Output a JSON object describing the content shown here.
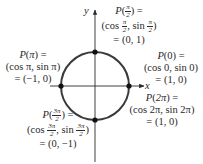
{
  "diagram": {
    "axes": {
      "x_label": "x",
      "y_label": "y"
    },
    "circle": {
      "center": [
        0,
        0
      ],
      "radius": 1,
      "color": "#3a3a3a"
    },
    "points": [
      {
        "id": "p_pi_over_2",
        "line1": "P(π/2) =",
        "line2": "(cos π/2, sin π/2)",
        "line3": "= (0, 1)",
        "coords": [
          0,
          1
        ]
      },
      {
        "id": "p_pi",
        "line1": "P(π) =",
        "line2": "(cos π, sin π)",
        "line3": "= (−1, 0)",
        "coords": [
          -1,
          0
        ]
      },
      {
        "id": "p_0",
        "line1": "P(0) =",
        "line2": "(cos 0, sin 0)",
        "line3": "= (1, 0)",
        "coords": [
          1,
          0
        ]
      },
      {
        "id": "p_2pi",
        "line1": "P(2π) =",
        "line2": "(cos 2π, sin 2π)",
        "line3": "= (1, 0)",
        "coords": [
          1,
          0
        ]
      },
      {
        "id": "p_3pi_over_2",
        "line1": "P(3π/2) =",
        "line2": "(cos 3π/2, sin 3π/2)",
        "line3": "= (0, −1)",
        "coords": [
          0,
          -1
        ]
      }
    ],
    "text": {
      "P": "P",
      "open": "(",
      "close": ")",
      "eq": " =",
      "pi": "π",
      "two_pi": "2π",
      "zero": "0",
      "pi_num": "π",
      "three_pi_num": "3π",
      "den2": "2",
      "cos": "cos ",
      "sin": "sin ",
      "comma": ", ",
      "cos_pi_pair": "(cos π, sin π)",
      "cos_0_pair": "(cos 0, sin 0)",
      "cos_2pi_pair": "(cos 2π, sin 2π)",
      "val_0_1": "= (0, 1)",
      "val_m1_0": "= (−1, 0)",
      "val_1_0_a": "= (1, 0)",
      "val_1_0_b": "= (1, 0)",
      "val_0_m1": "= (0, −1)"
    }
  }
}
